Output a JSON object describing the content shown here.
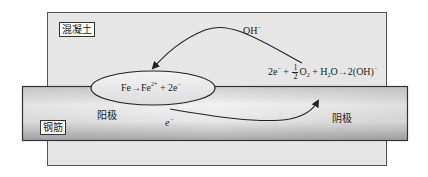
{
  "diagram": {
    "type": "corrosion-cell-schematic",
    "colors": {
      "concrete_fill": "#e6e6e6",
      "concrete_border": "#555555",
      "steel_light": "#f4f4f4",
      "steel_dark": "#b5b5b5",
      "steel_border": "#333333",
      "ellipse_fill": "#ececec",
      "line": "#222222"
    },
    "labels": {
      "concrete": "混凝土",
      "steel": "钢筋",
      "anode": "阳极",
      "cathode": "阴极",
      "electron": "e",
      "electron_charge": "−",
      "hydroxide": "OH",
      "hydroxide_charge": "−"
    },
    "anode_reaction": {
      "left": "Fe→Fe",
      "charge1": "2+",
      "right": " + 2e",
      "charge2": "−"
    },
    "cathode_reaction": {
      "part1": "2e",
      "part1_sup": "−",
      "plus1": " + ",
      "frac_num": "1",
      "frac_den": "2",
      "o2": "O",
      "o2_sub": "2",
      "plus2": " + H",
      "h2o_sub": "2",
      "h2o_rest": "O→2(OH)",
      "oh_sup": "−"
    },
    "arrows": [
      {
        "name": "hydroxide-migration",
        "from": "cathode",
        "to": "anode",
        "label": "OH−"
      },
      {
        "name": "electron-flow",
        "from": "anode",
        "to": "cathode",
        "label": "e−"
      }
    ]
  }
}
